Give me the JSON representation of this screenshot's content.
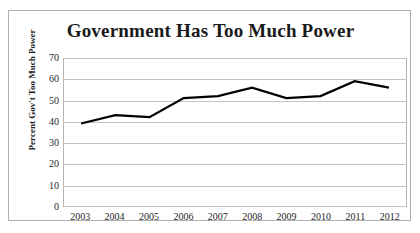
{
  "chart_data": {
    "type": "line",
    "title": "Government Has Too Much Power",
    "xlabel": "",
    "ylabel": "Percent Gov't Too Much Power",
    "categories": [
      "2003",
      "2004",
      "2005",
      "2006",
      "2007",
      "2008",
      "2009",
      "2010",
      "2011",
      "2012"
    ],
    "values": [
      39,
      43,
      42,
      51,
      52,
      56,
      51,
      52,
      59,
      56
    ],
    "series": [
      {
        "name": "Percent Gov't Too Much Power",
        "values": [
          39,
          43,
          42,
          51,
          52,
          56,
          51,
          52,
          59,
          56
        ]
      }
    ],
    "ylim": [
      0,
      70
    ],
    "yticks": [
      70,
      60,
      50,
      40,
      30,
      20,
      10,
      0
    ],
    "ytick_labels": [
      "70",
      "60",
      "50",
      "40",
      "30",
      "20",
      "10",
      "0"
    ],
    "grid": true,
    "grid_axis": "y",
    "legend": false,
    "legend_position": "none",
    "line_color": "#000000",
    "grid_color": "#c4c4c4",
    "background_color": "#ffffff",
    "border_color": "#b0b0b0"
  }
}
